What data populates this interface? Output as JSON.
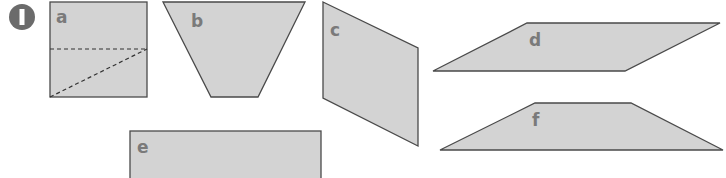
{
  "exercise": {
    "number": "1",
    "badge_color": "#6b6b6b"
  },
  "colors": {
    "fill": "#d3d3d3",
    "stroke": "#4a4a4a",
    "label": "#7a7a7a"
  },
  "shapes": [
    {
      "label": "a",
      "type": "square",
      "note": "with dashed cut lines"
    },
    {
      "label": "b",
      "type": "trapezoid (inverted)"
    },
    {
      "label": "c",
      "type": "parallelogram"
    },
    {
      "label": "d",
      "type": "parallelogram"
    },
    {
      "label": "e",
      "type": "rectangle"
    },
    {
      "label": "f",
      "type": "trapezoid"
    }
  ]
}
